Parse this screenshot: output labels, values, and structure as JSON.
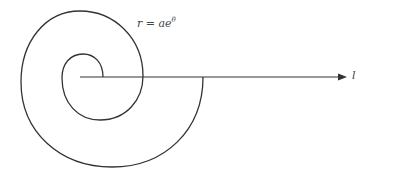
{
  "diagram": {
    "equation_label": {
      "prefix": "r = ae",
      "exponent": "θ"
    },
    "axis_label": "l",
    "colors": {
      "stroke": "#333333",
      "background": "#ffffff"
    },
    "geometry": {
      "pole": [
        80,
        77
      ],
      "axis_end": [
        347,
        77
      ],
      "spiral_start": [
        103,
        77
      ],
      "spiral_end": [
        203,
        77
      ]
    }
  }
}
